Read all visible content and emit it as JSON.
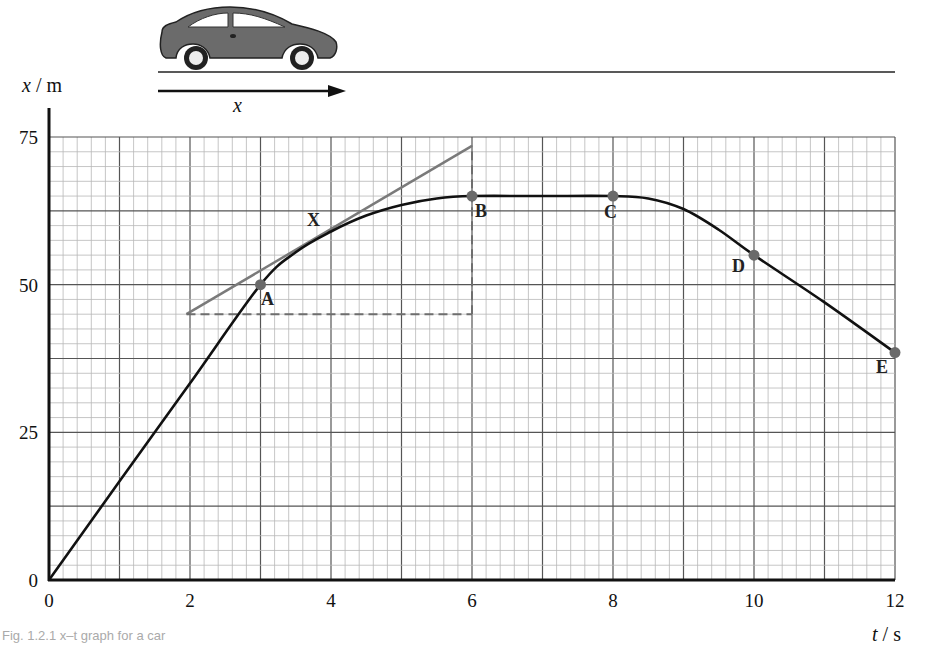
{
  "caption": "Fig. 1.2.1 x–t graph for a car",
  "diagram": {
    "car_icon": "car-side-view",
    "displacement_arrow_label": "x"
  },
  "chart_data": {
    "type": "line",
    "title": "x–t graph for a car",
    "xlabel": "t / s",
    "ylabel": "x / m",
    "xlim": [
      0,
      12
    ],
    "ylim": [
      0,
      75
    ],
    "x_ticks": [
      0,
      2,
      4,
      6,
      8,
      10,
      12
    ],
    "y_ticks": [
      0,
      25,
      50,
      75
    ],
    "grid": {
      "major_x": 1,
      "minor_x": 0.2,
      "major_y": 12.5,
      "minor_y": 2.5
    },
    "series": [
      {
        "name": "position of car",
        "x": [
          0,
          1,
          2,
          3,
          3.5,
          4,
          4.5,
          5,
          5.5,
          6,
          7,
          8,
          8.5,
          9,
          9.5,
          10,
          11,
          12
        ],
        "y": [
          0,
          16.7,
          33.3,
          50,
          55.5,
          59,
          61.7,
          63.5,
          64.6,
          65,
          65,
          65,
          64.6,
          62.8,
          59.3,
          55,
          47,
          38.5
        ]
      }
    ],
    "labeled_points": [
      {
        "label": "A",
        "t": 3,
        "x": 50
      },
      {
        "label": "B",
        "t": 6,
        "x": 65
      },
      {
        "label": "C",
        "t": 8,
        "x": 65
      },
      {
        "label": "D",
        "t": 10,
        "x": 55
      },
      {
        "label": "E",
        "t": 12,
        "x": 38.5
      }
    ],
    "annotations": [
      {
        "label": "X",
        "t": 4,
        "x": 59,
        "note": "point of tangency"
      },
      {
        "type": "tangent",
        "from": [
          1.95,
          45
        ],
        "to": [
          6,
          73.5
        ]
      },
      {
        "type": "dashed-horizontal",
        "from": [
          1.95,
          45
        ],
        "to": [
          6,
          45
        ]
      },
      {
        "type": "dashed-vertical",
        "from": [
          6,
          45
        ],
        "to": [
          6,
          73.5
        ]
      }
    ]
  },
  "axis": {
    "y_label_var": "x",
    "y_label_unit": "m",
    "x_label_var": "t",
    "x_label_unit": "s",
    "y_ticks": [
      "0",
      "25",
      "50",
      "75"
    ],
    "x_ticks": [
      "0",
      "2",
      "4",
      "6",
      "8",
      "10",
      "12"
    ]
  },
  "labels": {
    "A": "A",
    "B": "B",
    "C": "C",
    "D": "D",
    "E": "E",
    "X": "X"
  },
  "colors": {
    "curve": "#111111",
    "tangent": "#7a7a7a",
    "dashed": "#6e6e6e",
    "point": "#6a6a6a",
    "grid_major": "#555555",
    "grid_minor": "#b8b8b8",
    "car_body": "#6b6b6b"
  }
}
